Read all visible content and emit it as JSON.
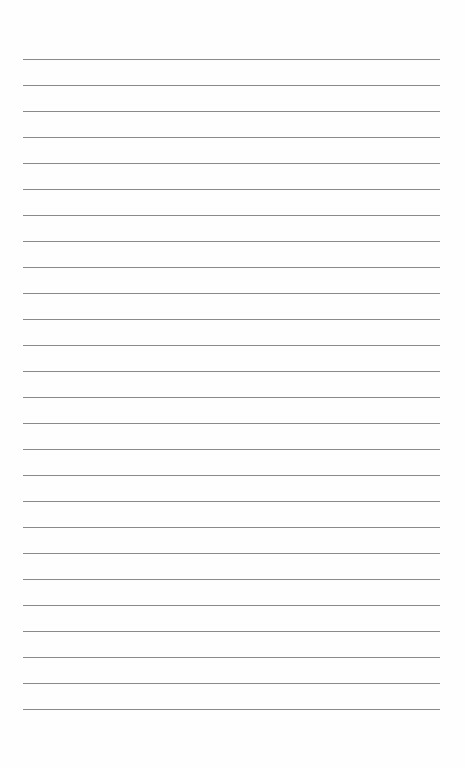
{
  "page": {
    "type": "lined-paper",
    "background_color": "#fefefe",
    "line_color": "#8a8a8a",
    "line_count": 26,
    "first_line_y": 59,
    "line_spacing": 26,
    "line_left": 23,
    "line_width": 417,
    "text": ""
  }
}
